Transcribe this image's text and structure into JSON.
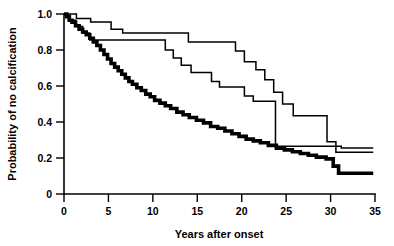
{
  "chart_data": {
    "type": "line",
    "title": "",
    "subtitle": "",
    "xlabel": "Years after onset",
    "ylabel": "Probability of no calcification",
    "xlim": [
      0,
      35
    ],
    "ylim": [
      0,
      1.0
    ],
    "xticks": [
      0,
      5,
      10,
      15,
      20,
      25,
      30,
      35
    ],
    "xticklabels": [
      "0",
      "5",
      "10",
      "15",
      "20",
      "25",
      "30",
      "35"
    ],
    "yticks": [
      0,
      0.2,
      0.4,
      0.6,
      0.8,
      1.0
    ],
    "yticklabels": [
      "0",
      "0.2",
      "0.4",
      "0.6",
      "0.8",
      "1.0"
    ],
    "grid": false,
    "legend": "none",
    "plot_style": "kaplan-meier step curves",
    "series": [
      {
        "name": "upper-thin-curve",
        "style": "thin",
        "color": "#000000",
        "linewidth": 1.5,
        "points": [
          [
            0.0,
            1.0
          ],
          [
            1.4,
            1.0
          ],
          [
            1.4,
            0.975
          ],
          [
            3.0,
            0.975
          ],
          [
            3.0,
            0.955
          ],
          [
            5.3,
            0.955
          ],
          [
            5.3,
            0.915
          ],
          [
            6.6,
            0.915
          ],
          [
            6.6,
            0.895
          ],
          [
            14.0,
            0.895
          ],
          [
            14.0,
            0.845
          ],
          [
            19.3,
            0.845
          ],
          [
            19.3,
            0.795
          ],
          [
            20.3,
            0.795
          ],
          [
            20.3,
            0.735
          ],
          [
            21.6,
            0.735
          ],
          [
            21.6,
            0.69
          ],
          [
            22.6,
            0.69
          ],
          [
            22.6,
            0.635
          ],
          [
            23.6,
            0.635
          ],
          [
            23.6,
            0.565
          ],
          [
            24.6,
            0.565
          ],
          [
            24.6,
            0.5
          ],
          [
            25.8,
            0.5
          ],
          [
            25.8,
            0.435
          ],
          [
            29.6,
            0.435
          ],
          [
            29.6,
            0.29
          ],
          [
            30.6,
            0.29
          ],
          [
            30.6,
            0.232
          ],
          [
            34.8,
            0.232
          ]
        ]
      },
      {
        "name": "middle-thin-curve",
        "style": "thin",
        "color": "#000000",
        "linewidth": 1.5,
        "points": [
          [
            0.0,
            1.0
          ],
          [
            0.5,
            1.0
          ],
          [
            0.5,
            0.965
          ],
          [
            1.3,
            0.965
          ],
          [
            1.3,
            0.93
          ],
          [
            2.1,
            0.93
          ],
          [
            2.1,
            0.895
          ],
          [
            2.9,
            0.895
          ],
          [
            2.9,
            0.855
          ],
          [
            11.4,
            0.855
          ],
          [
            11.4,
            0.8
          ],
          [
            12.3,
            0.8
          ],
          [
            12.3,
            0.755
          ],
          [
            13.2,
            0.755
          ],
          [
            13.2,
            0.715
          ],
          [
            14.3,
            0.715
          ],
          [
            14.3,
            0.675
          ],
          [
            16.6,
            0.675
          ],
          [
            16.6,
            0.625
          ],
          [
            17.5,
            0.625
          ],
          [
            17.5,
            0.595
          ],
          [
            20.3,
            0.595
          ],
          [
            20.3,
            0.545
          ],
          [
            21.3,
            0.545
          ],
          [
            21.3,
            0.515
          ],
          [
            23.8,
            0.515
          ],
          [
            23.8,
            0.265
          ],
          [
            31.2,
            0.265
          ],
          [
            31.2,
            0.255
          ],
          [
            34.8,
            0.255
          ]
        ]
      },
      {
        "name": "lower-thick-curve",
        "style": "thick",
        "color": "#000000",
        "linewidth": 3.6,
        "points": [
          [
            0.0,
            1.0
          ],
          [
            0.3,
            1.0
          ],
          [
            0.3,
            0.985
          ],
          [
            0.6,
            0.985
          ],
          [
            0.6,
            0.965
          ],
          [
            0.9,
            0.965
          ],
          [
            0.9,
            0.955
          ],
          [
            1.3,
            0.955
          ],
          [
            1.3,
            0.935
          ],
          [
            1.7,
            0.935
          ],
          [
            1.7,
            0.915
          ],
          [
            2.1,
            0.915
          ],
          [
            2.1,
            0.9
          ],
          [
            2.5,
            0.9
          ],
          [
            2.5,
            0.885
          ],
          [
            2.9,
            0.885
          ],
          [
            2.9,
            0.865
          ],
          [
            3.3,
            0.865
          ],
          [
            3.3,
            0.845
          ],
          [
            3.7,
            0.845
          ],
          [
            3.7,
            0.825
          ],
          [
            4.1,
            0.825
          ],
          [
            4.1,
            0.8
          ],
          [
            4.5,
            0.8
          ],
          [
            4.5,
            0.775
          ],
          [
            4.9,
            0.775
          ],
          [
            4.9,
            0.75
          ],
          [
            5.3,
            0.75
          ],
          [
            5.3,
            0.725
          ],
          [
            5.7,
            0.725
          ],
          [
            5.7,
            0.705
          ],
          [
            6.1,
            0.705
          ],
          [
            6.1,
            0.685
          ],
          [
            6.5,
            0.685
          ],
          [
            6.5,
            0.665
          ],
          [
            6.9,
            0.665
          ],
          [
            6.9,
            0.645
          ],
          [
            7.3,
            0.645
          ],
          [
            7.3,
            0.625
          ],
          [
            7.7,
            0.625
          ],
          [
            7.7,
            0.61
          ],
          [
            8.2,
            0.61
          ],
          [
            8.2,
            0.59
          ],
          [
            8.7,
            0.59
          ],
          [
            8.7,
            0.575
          ],
          [
            9.2,
            0.575
          ],
          [
            9.2,
            0.555
          ],
          [
            9.7,
            0.555
          ],
          [
            9.7,
            0.54
          ],
          [
            10.2,
            0.54
          ],
          [
            10.2,
            0.52
          ],
          [
            10.8,
            0.52
          ],
          [
            10.8,
            0.505
          ],
          [
            11.4,
            0.505
          ],
          [
            11.4,
            0.49
          ],
          [
            12.0,
            0.49
          ],
          [
            12.0,
            0.475
          ],
          [
            12.7,
            0.475
          ],
          [
            12.7,
            0.455
          ],
          [
            13.4,
            0.455
          ],
          [
            13.4,
            0.44
          ],
          [
            14.1,
            0.44
          ],
          [
            14.1,
            0.425
          ],
          [
            14.9,
            0.425
          ],
          [
            14.9,
            0.41
          ],
          [
            15.7,
            0.41
          ],
          [
            15.7,
            0.395
          ],
          [
            16.5,
            0.395
          ],
          [
            16.5,
            0.375
          ],
          [
            17.3,
            0.375
          ],
          [
            17.3,
            0.365
          ],
          [
            18.1,
            0.365
          ],
          [
            18.1,
            0.35
          ],
          [
            18.9,
            0.35
          ],
          [
            18.9,
            0.335
          ],
          [
            19.7,
            0.335
          ],
          [
            19.7,
            0.32
          ],
          [
            20.5,
            0.32
          ],
          [
            20.5,
            0.305
          ],
          [
            21.3,
            0.305
          ],
          [
            21.3,
            0.295
          ],
          [
            22.1,
            0.295
          ],
          [
            22.1,
            0.285
          ],
          [
            23.0,
            0.285
          ],
          [
            23.0,
            0.27
          ],
          [
            23.9,
            0.27
          ],
          [
            23.9,
            0.255
          ],
          [
            24.8,
            0.255
          ],
          [
            24.8,
            0.245
          ],
          [
            25.7,
            0.245
          ],
          [
            25.7,
            0.235
          ],
          [
            26.6,
            0.235
          ],
          [
            26.6,
            0.225
          ],
          [
            27.5,
            0.225
          ],
          [
            27.5,
            0.215
          ],
          [
            28.4,
            0.215
          ],
          [
            28.4,
            0.205
          ],
          [
            29.5,
            0.205
          ],
          [
            29.5,
            0.195
          ],
          [
            30.3,
            0.195
          ],
          [
            30.3,
            0.155
          ],
          [
            30.9,
            0.155
          ],
          [
            30.9,
            0.115
          ],
          [
            34.8,
            0.115
          ]
        ]
      }
    ],
    "annotations": []
  }
}
